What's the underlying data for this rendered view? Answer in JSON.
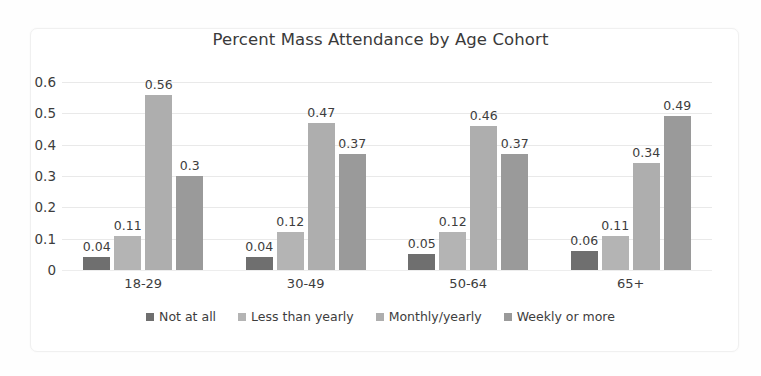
{
  "chart_data": {
    "type": "bar",
    "title": "Percent Mass Attendance by Age Cohort",
    "xlabel": "",
    "ylabel": "",
    "ylim": [
      0,
      0.6
    ],
    "ytick_step": 0.1,
    "yticks": [
      "0.6",
      "0.5",
      "0.4",
      "0.3",
      "0.2",
      "0.1",
      "0"
    ],
    "grid": true,
    "legend_position": "bottom",
    "categories": [
      "18-29",
      "30-49",
      "50-64",
      "65+"
    ],
    "series": [
      {
        "name": "Not at all",
        "color": "#6f6f6f",
        "values": [
          0.04,
          0.04,
          0.05,
          0.06
        ],
        "labels": [
          "0.04",
          "0.04",
          "0.05",
          "0.06"
        ]
      },
      {
        "name": "Less than yearly",
        "color": "#b4b4b4",
        "values": [
          0.11,
          0.12,
          0.12,
          0.11
        ],
        "labels": [
          "0.11",
          "0.12",
          "0.12",
          "0.11"
        ]
      },
      {
        "name": "Monthly/yearly",
        "color": "#aeaeae",
        "values": [
          0.56,
          0.47,
          0.46,
          0.34
        ],
        "labels": [
          "0.56",
          "0.47",
          "0.46",
          "0.34"
        ]
      },
      {
        "name": "Weekly or more",
        "color": "#9a9a9a",
        "values": [
          0.3,
          0.37,
          0.37,
          0.49
        ],
        "labels": [
          "0.3",
          "0.37",
          "0.37",
          "0.49"
        ]
      }
    ]
  },
  "colors": {
    "grid": "#e9e9e9",
    "text": "#3d3d3d",
    "background": "#ffffff",
    "frame": "#f0f0f0"
  }
}
